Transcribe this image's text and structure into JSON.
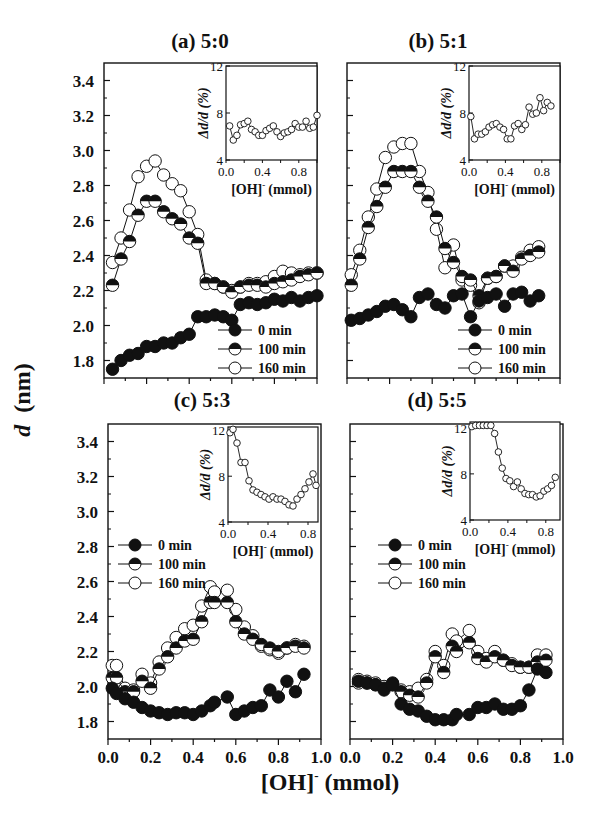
{
  "figure": {
    "ylabel": "d (nm)",
    "ylabel_italic": "d",
    "ylabel_unit": "(nm)",
    "xlabel": "[OH]⁻ (mmol)",
    "xlabel_main": "[OH]",
    "xlabel_sup": "-",
    "xlabel_unit": "(mmol)"
  },
  "chart_data": [
    {
      "type": "line",
      "title": "(a) 5:0",
      "xlabel": "[OH]- (mmol)",
      "ylabel": "d (nm)",
      "xlim": [
        0.0,
        1.0
      ],
      "ylim": [
        1.7,
        3.5
      ],
      "xticks": [
        "0.0",
        "0.2",
        "0.4",
        "0.6",
        "0.8",
        "1.0"
      ],
      "yticks": [
        "1.8",
        "2.0",
        "2.2",
        "2.4",
        "2.6",
        "2.8",
        "3.0",
        "3.2",
        "3.4"
      ],
      "legend": [
        "0 min",
        "100 min",
        "160 min"
      ],
      "legend_pos": "lower right",
      "series": [
        {
          "name": "0 min",
          "marker": "filled",
          "x": [
            0.04,
            0.08,
            0.12,
            0.16,
            0.2,
            0.24,
            0.28,
            0.32,
            0.36,
            0.4,
            0.44,
            0.48,
            0.52,
            0.56,
            0.6,
            0.64,
            0.68,
            0.72,
            0.76,
            0.8,
            0.84,
            0.88,
            0.92,
            0.96,
            1.0
          ],
          "y": [
            1.75,
            1.8,
            1.83,
            1.84,
            1.88,
            1.88,
            1.9,
            1.9,
            1.93,
            1.95,
            2.05,
            2.05,
            2.06,
            2.05,
            2.03,
            2.12,
            2.13,
            2.12,
            2.13,
            2.15,
            2.14,
            2.16,
            2.14,
            2.16,
            2.17
          ]
        },
        {
          "name": "100 min",
          "marker": "half",
          "x": [
            0.04,
            0.08,
            0.12,
            0.16,
            0.2,
            0.24,
            0.28,
            0.32,
            0.36,
            0.4,
            0.44,
            0.48,
            0.52,
            0.56,
            0.6,
            0.64,
            0.68,
            0.72,
            0.76,
            0.8,
            0.84,
            0.88,
            0.92,
            0.96,
            1.0
          ],
          "y": [
            2.23,
            2.38,
            2.48,
            2.63,
            2.71,
            2.71,
            2.65,
            2.61,
            2.58,
            2.5,
            2.47,
            2.24,
            2.24,
            2.22,
            2.19,
            2.22,
            2.23,
            2.23,
            2.22,
            2.24,
            2.25,
            2.26,
            2.28,
            2.29,
            2.3
          ]
        },
        {
          "name": "160 min",
          "marker": "open",
          "x": [
            0.04,
            0.08,
            0.12,
            0.16,
            0.2,
            0.24,
            0.28,
            0.32,
            0.36,
            0.4,
            0.44,
            0.48,
            0.52,
            0.56,
            0.6,
            0.64,
            0.68,
            0.72,
            0.76,
            0.8,
            0.84,
            0.88,
            0.92,
            0.96,
            1.0
          ],
          "y": [
            2.36,
            2.5,
            2.66,
            2.85,
            2.91,
            2.94,
            2.86,
            2.81,
            2.77,
            2.65,
            2.52,
            2.26,
            2.24,
            2.22,
            2.2,
            2.22,
            2.24,
            2.24,
            2.25,
            2.28,
            2.31,
            2.3,
            2.29,
            2.3,
            2.3
          ]
        }
      ],
      "inset": {
        "ylabel": "Δd/d (%)",
        "xlabel": "[OH]- (mmol)",
        "xlim": [
          0.0,
          1.0
        ],
        "ylim": [
          4,
          12
        ],
        "xticks": [
          "0.0",
          "0.4",
          "0.8"
        ],
        "yticks": [
          "4",
          "8",
          "12"
        ],
        "x": [
          0.04,
          0.08,
          0.12,
          0.16,
          0.2,
          0.24,
          0.28,
          0.32,
          0.36,
          0.4,
          0.44,
          0.48,
          0.52,
          0.56,
          0.6,
          0.64,
          0.68,
          0.72,
          0.76,
          0.8,
          0.84,
          0.88,
          0.92,
          0.96,
          1.0
        ],
        "y": [
          6.9,
          5.7,
          6.1,
          7.0,
          7.1,
          7.3,
          6.6,
          6.4,
          6.1,
          6.1,
          6.5,
          6.7,
          6.9,
          6.4,
          6.0,
          6.3,
          6.4,
          6.6,
          7.1,
          6.8,
          6.8,
          7.3,
          6.7,
          6.8,
          7.8
        ]
      }
    },
    {
      "type": "line",
      "title": "(b) 5:1",
      "xlabel": "[OH]- (mmol)",
      "ylabel": "d (nm)",
      "xlim": [
        0.0,
        1.0
      ],
      "ylim": [
        1.7,
        3.5
      ],
      "xticks": [
        "0.0",
        "0.2",
        "0.4",
        "0.6",
        "0.8",
        "1.0"
      ],
      "yticks": [
        "1.8",
        "2.0",
        "2.2",
        "2.4",
        "2.6",
        "2.8",
        "3.0",
        "3.2",
        "3.4"
      ],
      "legend": [
        "0 min",
        "100 min",
        "160 min"
      ],
      "legend_pos": "lower right",
      "series": [
        {
          "name": "0 min",
          "marker": "filled",
          "x": [
            0.02,
            0.06,
            0.1,
            0.14,
            0.18,
            0.22,
            0.26,
            0.3,
            0.34,
            0.38,
            0.42,
            0.46,
            0.5,
            0.54,
            0.58,
            0.62,
            0.66,
            0.7,
            0.74,
            0.78,
            0.82,
            0.86,
            0.9
          ],
          "y": [
            2.03,
            2.04,
            2.06,
            2.08,
            2.11,
            2.12,
            2.09,
            2.05,
            2.16,
            2.18,
            2.12,
            2.1,
            2.17,
            2.18,
            2.05,
            2.14,
            2.16,
            2.18,
            2.11,
            2.18,
            2.19,
            2.14,
            2.17
          ]
        },
        {
          "name": "100 min",
          "marker": "half",
          "x": [
            0.02,
            0.06,
            0.1,
            0.14,
            0.18,
            0.22,
            0.26,
            0.3,
            0.34,
            0.38,
            0.42,
            0.46,
            0.5,
            0.54,
            0.58,
            0.62,
            0.66,
            0.7,
            0.74,
            0.78,
            0.82,
            0.86,
            0.9
          ],
          "y": [
            2.23,
            2.38,
            2.56,
            2.68,
            2.79,
            2.88,
            2.88,
            2.88,
            2.79,
            2.71,
            2.62,
            2.44,
            2.36,
            2.28,
            2.26,
            2.17,
            2.27,
            2.28,
            2.34,
            2.31,
            2.38,
            2.4,
            2.42
          ]
        },
        {
          "name": "160 min",
          "marker": "open",
          "x": [
            0.02,
            0.06,
            0.1,
            0.14,
            0.18,
            0.22,
            0.26,
            0.3,
            0.34,
            0.38,
            0.42,
            0.46,
            0.5,
            0.54,
            0.58,
            0.62,
            0.66,
            0.7,
            0.74,
            0.78,
            0.82,
            0.86,
            0.9
          ],
          "y": [
            2.29,
            2.43,
            2.62,
            2.78,
            2.96,
            3.02,
            3.04,
            3.04,
            2.88,
            2.76,
            2.55,
            2.33,
            2.46,
            2.26,
            2.23,
            2.13,
            2.27,
            2.28,
            2.34,
            2.34,
            2.39,
            2.43,
            2.45
          ]
        }
      ],
      "inset": {
        "ylabel": "Δd/d (%)",
        "xlabel": "[OH]- (mmol)",
        "xlim": [
          0.0,
          1.0
        ],
        "ylim": [
          4,
          12
        ],
        "xticks": [
          "0.0",
          "0.4",
          "0.8"
        ],
        "yticks": [
          "4",
          "8",
          "12"
        ],
        "x": [
          0.02,
          0.06,
          0.1,
          0.14,
          0.18,
          0.22,
          0.26,
          0.3,
          0.34,
          0.38,
          0.42,
          0.46,
          0.5,
          0.54,
          0.58,
          0.62,
          0.66,
          0.7,
          0.74,
          0.78,
          0.82,
          0.86,
          0.9
        ],
        "y": [
          7.7,
          5.8,
          6.2,
          6.2,
          6.4,
          6.8,
          7.0,
          7.1,
          6.8,
          6.6,
          5.8,
          5.8,
          6.9,
          7.1,
          6.6,
          7.0,
          8.5,
          7.9,
          8.0,
          9.3,
          8.2,
          8.9,
          8.6
        ]
      }
    },
    {
      "type": "line",
      "title": "(c) 5:3",
      "xlabel": "[OH]- (mmol)",
      "ylabel": "d (nm)",
      "xlim": [
        0.0,
        1.0
      ],
      "ylim": [
        1.7,
        3.5
      ],
      "xticks": [
        "0.0",
        "0.2",
        "0.4",
        "0.6",
        "0.8",
        "1.0"
      ],
      "yticks": [
        "1.8",
        "2.0",
        "2.2",
        "2.4",
        "2.6",
        "2.8",
        "3.0",
        "3.2",
        "3.4"
      ],
      "legend": [
        "0 min",
        "100 min",
        "160 min"
      ],
      "legend_pos": "upper left",
      "series": [
        {
          "name": "0 min",
          "marker": "filled",
          "x": [
            0.02,
            0.04,
            0.08,
            0.12,
            0.16,
            0.2,
            0.24,
            0.28,
            0.32,
            0.36,
            0.4,
            0.44,
            0.48,
            0.5,
            0.56,
            0.6,
            0.64,
            0.68,
            0.72,
            0.76,
            0.8,
            0.84,
            0.88,
            0.92
          ],
          "y": [
            1.99,
            1.96,
            1.93,
            1.91,
            1.88,
            1.86,
            1.85,
            1.84,
            1.85,
            1.85,
            1.84,
            1.86,
            1.89,
            1.91,
            1.94,
            1.84,
            1.86,
            1.88,
            1.89,
            1.98,
            1.94,
            2.03,
            1.97,
            2.07
          ]
        },
        {
          "name": "100 min",
          "marker": "half",
          "x": [
            0.02,
            0.04,
            0.08,
            0.12,
            0.16,
            0.2,
            0.24,
            0.28,
            0.32,
            0.36,
            0.4,
            0.44,
            0.48,
            0.5,
            0.56,
            0.6,
            0.64,
            0.68,
            0.72,
            0.76,
            0.8,
            0.84,
            0.88,
            0.92
          ],
          "y": [
            2.05,
            2.05,
            1.97,
            1.97,
            2.03,
            1.99,
            2.1,
            2.17,
            2.22,
            2.26,
            2.27,
            2.37,
            2.48,
            2.48,
            2.48,
            2.37,
            2.3,
            2.27,
            2.24,
            2.22,
            2.2,
            2.22,
            2.23,
            2.22
          ]
        },
        {
          "name": "160 min",
          "marker": "open",
          "x": [
            0.02,
            0.04,
            0.08,
            0.12,
            0.16,
            0.2,
            0.24,
            0.28,
            0.32,
            0.36,
            0.4,
            0.44,
            0.48,
            0.5,
            0.56,
            0.6,
            0.64,
            0.68,
            0.72,
            0.76,
            0.8,
            0.84,
            0.88,
            0.92
          ],
          "y": [
            2.12,
            2.12,
            1.99,
            1.98,
            2.07,
            2.02,
            2.14,
            2.22,
            2.28,
            2.33,
            2.35,
            2.46,
            2.57,
            2.54,
            2.55,
            2.44,
            2.34,
            2.29,
            2.23,
            2.21,
            2.19,
            2.22,
            2.24,
            2.23
          ]
        }
      ],
      "inset": {
        "ylabel": "Δd/d (%)",
        "xlabel": "[OH]- (mmol)",
        "xlim": [
          0.0,
          0.9
        ],
        "ylim": [
          4,
          12.3
        ],
        "xticks": [
          "0.0",
          "0.4",
          "0.8"
        ],
        "yticks": [
          "4",
          "8",
          "12"
        ],
        "x": [
          0.02,
          0.05,
          0.09,
          0.13,
          0.17,
          0.21,
          0.25,
          0.29,
          0.33,
          0.37,
          0.41,
          0.45,
          0.49,
          0.53,
          0.57,
          0.61,
          0.65,
          0.69,
          0.73,
          0.77,
          0.81,
          0.85,
          0.88
        ],
        "y": [
          11.8,
          12.1,
          10.9,
          9.2,
          9.2,
          7.6,
          6.8,
          6.6,
          6.4,
          6.2,
          6.0,
          6.2,
          6.0,
          6.0,
          5.8,
          5.5,
          5.4,
          6.0,
          6.4,
          6.9,
          7.5,
          8.2,
          7.2
        ]
      }
    },
    {
      "type": "line",
      "title": "(d) 5:5",
      "xlabel": "[OH]- (mmol)",
      "ylabel": "d (nm)",
      "xlim": [
        0.0,
        1.0
      ],
      "ylim": [
        1.7,
        3.5
      ],
      "xticks": [
        "0.0",
        "0.2",
        "0.4",
        "0.6",
        "0.8",
        "1.0"
      ],
      "yticks": [
        "1.8",
        "2.0",
        "2.2",
        "2.4",
        "2.6",
        "2.8",
        "3.0",
        "3.2",
        "3.4"
      ],
      "legend": [
        "0 min",
        "100 min",
        "160 min"
      ],
      "legend_pos": "center left",
      "series": [
        {
          "name": "0 min",
          "marker": "filled",
          "x": [
            0.04,
            0.08,
            0.12,
            0.16,
            0.2,
            0.24,
            0.28,
            0.32,
            0.36,
            0.4,
            0.44,
            0.48,
            0.5,
            0.56,
            0.6,
            0.64,
            0.68,
            0.72,
            0.76,
            0.8,
            0.84,
            0.88,
            0.92
          ],
          "y": [
            2.03,
            2.02,
            2.01,
            1.98,
            2.01,
            1.9,
            1.87,
            1.86,
            1.83,
            1.81,
            1.81,
            1.81,
            1.84,
            1.84,
            1.88,
            1.88,
            1.9,
            1.87,
            1.87,
            1.89,
            1.98,
            2.1,
            2.08
          ]
        },
        {
          "name": "100 min",
          "marker": "half",
          "x": [
            0.04,
            0.08,
            0.12,
            0.16,
            0.2,
            0.24,
            0.28,
            0.32,
            0.36,
            0.4,
            0.44,
            0.48,
            0.5,
            0.56,
            0.6,
            0.64,
            0.68,
            0.72,
            0.76,
            0.8,
            0.84,
            0.88,
            0.92
          ],
          "y": [
            2.02,
            2.02,
            2.01,
            1.99,
            2.02,
            1.97,
            1.95,
            1.94,
            2.02,
            2.17,
            2.08,
            2.23,
            2.2,
            2.25,
            2.16,
            2.14,
            2.17,
            2.15,
            2.12,
            2.11,
            2.11,
            2.14,
            2.15
          ]
        },
        {
          "name": "160 min",
          "marker": "open",
          "x": [
            0.04,
            0.08,
            0.12,
            0.16,
            0.2,
            0.24,
            0.28,
            0.32,
            0.36,
            0.4,
            0.44,
            0.48,
            0.5,
            0.56,
            0.6,
            0.64,
            0.68,
            0.72,
            0.76,
            0.8,
            0.84,
            0.88,
            0.92
          ],
          "y": [
            2.04,
            2.03,
            2.02,
            2.0,
            2.01,
            1.98,
            1.97,
            1.99,
            2.04,
            2.2,
            2.12,
            2.3,
            2.26,
            2.32,
            2.2,
            2.16,
            2.2,
            2.15,
            2.13,
            2.11,
            2.11,
            2.18,
            2.18
          ]
        }
      ],
      "inset": {
        "ylabel": "Δd/d (%)",
        "xlabel": "[OH]- (mmol)",
        "xlim": [
          0.0,
          0.95
        ],
        "ylim": [
          4,
          12.5
        ],
        "xticks": [
          "0.0",
          "0.4",
          "0.8"
        ],
        "yticks": [
          "4",
          "8",
          "12"
        ],
        "x": [
          0.02,
          0.06,
          0.1,
          0.14,
          0.18,
          0.22,
          0.26,
          0.3,
          0.34,
          0.38,
          0.42,
          0.46,
          0.5,
          0.54,
          0.58,
          0.62,
          0.66,
          0.7,
          0.74,
          0.78,
          0.82,
          0.86,
          0.9
        ],
        "y": [
          12.1,
          12.2,
          12.2,
          12.2,
          12.2,
          12.2,
          11.5,
          9.9,
          8.5,
          7.6,
          7.4,
          6.9,
          7.3,
          6.7,
          6.3,
          6.2,
          6.2,
          6.0,
          6.1,
          6.5,
          6.7,
          7.0,
          7.7
        ]
      }
    }
  ]
}
